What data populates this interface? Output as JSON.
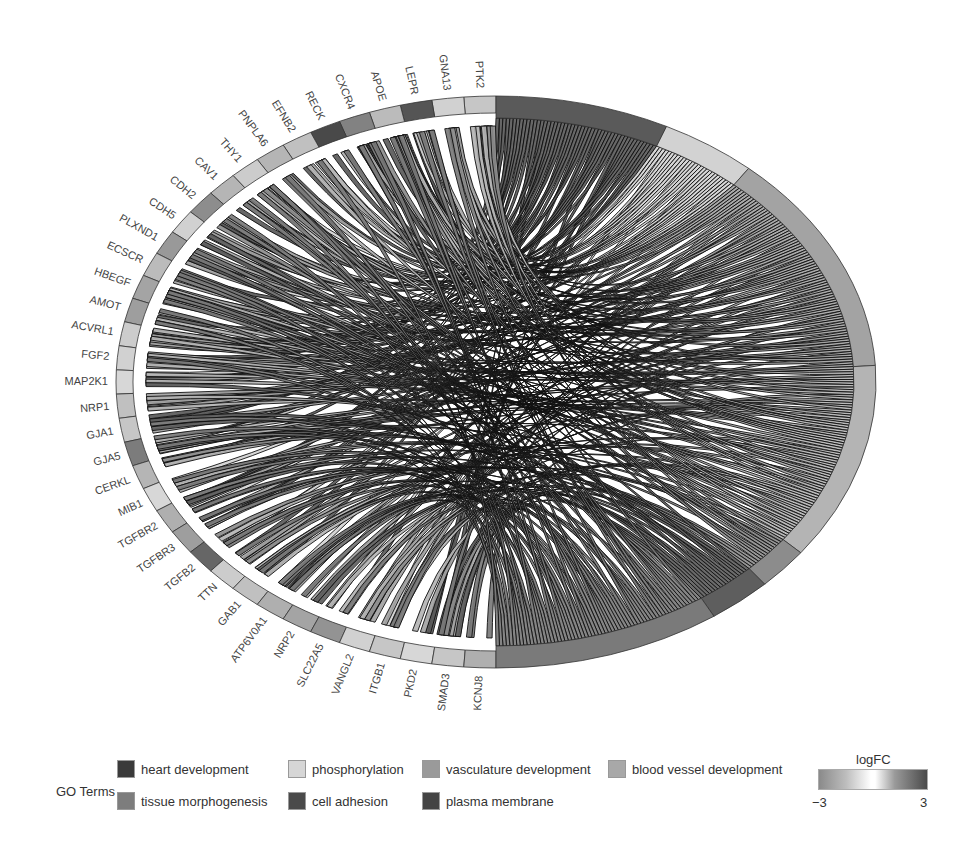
{
  "chart_data": {
    "type": "chord",
    "title": "",
    "genes": [
      {
        "name": "PTK2",
        "logFC": 0.6
      },
      {
        "name": "GNA13",
        "logFC": 0.4
      },
      {
        "name": "LEPR",
        "logFC": 2.6
      },
      {
        "name": "APOE",
        "logFC": 0.8
      },
      {
        "name": "CXCR4",
        "logFC": 1.8
      },
      {
        "name": "RECK",
        "logFC": 2.8
      },
      {
        "name": "EFNB2",
        "logFC": 0.7
      },
      {
        "name": "PNPLA6",
        "logFC": 0.9
      },
      {
        "name": "THY1",
        "logFC": 0.5
      },
      {
        "name": "CAV1",
        "logFC": 0.9
      },
      {
        "name": "CDH2",
        "logFC": 1.6
      },
      {
        "name": "CDH5",
        "logFC": 0.4
      },
      {
        "name": "PLXND1",
        "logFC": 1.4
      },
      {
        "name": "ECSCR",
        "logFC": 0.8
      },
      {
        "name": "HBEGF",
        "logFC": 1.2
      },
      {
        "name": "AMOT",
        "logFC": 1.3
      },
      {
        "name": "ACVRL1",
        "logFC": 0.5
      },
      {
        "name": "FGF2",
        "logFC": 0.4
      },
      {
        "name": "MAP2K1",
        "logFC": 0.3
      },
      {
        "name": "NRP1",
        "logFC": 0.7
      },
      {
        "name": "GJA1",
        "logFC": 0.6
      },
      {
        "name": "GJA5",
        "logFC": 1.9
      },
      {
        "name": "CERKL",
        "logFC": 0.9
      },
      {
        "name": "MIB1",
        "logFC": 0.3
      },
      {
        "name": "TGFBR2",
        "logFC": 1.0
      },
      {
        "name": "TGFBR3",
        "logFC": 1.3
      },
      {
        "name": "TGFB2",
        "logFC": 2.3
      },
      {
        "name": "TTN",
        "logFC": 0.5
      },
      {
        "name": "GAB1",
        "logFC": 0.7
      },
      {
        "name": "ATP6V0A1",
        "logFC": 1.0
      },
      {
        "name": "NRP2",
        "logFC": 1.2
      },
      {
        "name": "SLC22A5",
        "logFC": 1.5
      },
      {
        "name": "VANGL2",
        "logFC": 0.4
      },
      {
        "name": "ITGB1",
        "logFC": 0.6
      },
      {
        "name": "PKD2",
        "logFC": 0.3
      },
      {
        "name": "SMAD3",
        "logFC": 0.6
      },
      {
        "name": "KCNJ8",
        "logFC": 1.0
      },
      {
        "name": "KCNJ8_end",
        "logFC": 0.4
      }
    ],
    "go_terms": [
      {
        "name": "heart development",
        "color": "#5a5a5a",
        "weight": 16
      },
      {
        "name": "phosphorylation",
        "color": "#d2d2d2",
        "weight": 9
      },
      {
        "name": "vasculature development",
        "color": "#a3a3a3",
        "weight": 27
      },
      {
        "name": "blood vessel development",
        "color": "#b4b4b4",
        "weight": 24
      },
      {
        "name": "tissue morphogenesis",
        "color": "#8c8c8c",
        "weight": 5
      },
      {
        "name": "cell adhesion",
        "color": "#5e5e5e",
        "weight": 6
      },
      {
        "name": "plasma membrane",
        "color": "#7a7a7a",
        "weight": 21
      }
    ],
    "legend": {
      "title": "GO Terms",
      "colorbar_title": "logFC",
      "colorbar_range": [
        -3,
        3
      ]
    }
  },
  "legend": {
    "title": "GO Terms",
    "items": [
      {
        "label": "heart development",
        "color": "#3a3a3a"
      },
      {
        "label": "phosphorylation",
        "color": "#d6d6d6"
      },
      {
        "label": "vasculature development",
        "color": "#9a9a9a"
      },
      {
        "label": "blood vessel development",
        "color": "#a8a8a8"
      },
      {
        "label": "tissue morphogenesis",
        "color": "#7d7d7d"
      },
      {
        "label": "cell adhesion",
        "color": "#4a4a4a"
      },
      {
        "label": "plasma membrane",
        "color": "#444444"
      }
    ],
    "colorbar": {
      "title": "logFC",
      "min_label": "−3",
      "max_label": "3"
    }
  }
}
